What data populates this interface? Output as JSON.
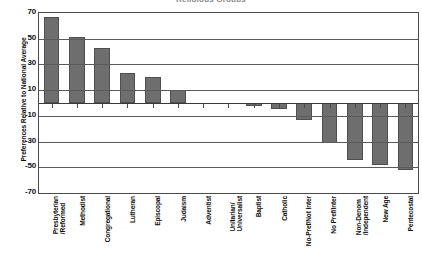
{
  "title": "Religious Groups",
  "axis": {
    "ylabel": "Preferences Relative to National Average",
    "yticks": [
      "70",
      "50",
      "30",
      "10",
      "-10",
      "-30",
      "-50",
      "-70"
    ]
  },
  "chart_data": {
    "type": "bar",
    "title": "Religious Groups",
    "xlabel": "",
    "ylabel": "Preferences Relative to National Average",
    "ylim": [
      -70,
      70
    ],
    "ytick_values": [
      70,
      50,
      30,
      10,
      -10,
      -30,
      -50,
      -70
    ],
    "grid": true,
    "legend": false,
    "bar_color": "#6e6e6e",
    "categories": [
      "Presbyterian /Reformed",
      "Methodist",
      "Congregational",
      "Lutheran",
      "Episcopal",
      "Judaism",
      "Adventist",
      "Unitarian/ Universalist",
      "Baptist",
      "Catholic",
      "No-Pref/Not Inter",
      "No Pref/Inter",
      "Non-Denom /Independent",
      "New Age",
      "Pentecostal"
    ],
    "values": [
      67,
      51,
      43,
      23,
      20,
      10,
      0,
      0,
      -2,
      -5,
      -13,
      -31,
      -44,
      -48,
      -52
    ]
  }
}
